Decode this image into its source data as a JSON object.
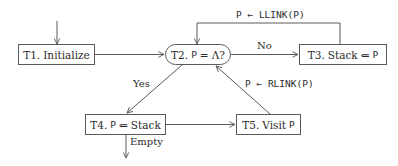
{
  "diagram": {
    "type": "flowchart",
    "title": "",
    "nodes": {
      "t1": {
        "id": "T1",
        "prefix": "T1.",
        "text": "Initialize",
        "shape": "rect"
      },
      "t2": {
        "id": "T2",
        "prefix": "T2.",
        "var": "P",
        "op": "=",
        "rhs": "Λ?",
        "shape": "rounded"
      },
      "t3": {
        "id": "T3",
        "prefix": "T3.",
        "text": "Stack",
        "op": "⇐",
        "var": "P",
        "shape": "rect"
      },
      "t4": {
        "id": "T4",
        "prefix": "T4.",
        "var": "P",
        "op": "⇐",
        "text": "Stack",
        "shape": "rect"
      },
      "t5": {
        "id": "T5",
        "prefix": "T5.",
        "text": "Visit",
        "var": "P",
        "shape": "rect"
      }
    },
    "edges": [
      {
        "from": "start",
        "to": "T1",
        "label": ""
      },
      {
        "from": "T1",
        "to": "T2",
        "label": ""
      },
      {
        "from": "T2",
        "to": "T3",
        "label": "No"
      },
      {
        "from": "T3",
        "to": "T2",
        "label": "P ← LLINK(P)"
      },
      {
        "from": "T2",
        "to": "T4",
        "label": "Yes"
      },
      {
        "from": "T4",
        "to": "T5",
        "label": ""
      },
      {
        "from": "T5",
        "to": "T2",
        "label": "P ← RLINK(P)"
      },
      {
        "from": "T4",
        "to": "end",
        "label": "Empty"
      }
    ],
    "labels": {
      "no": "No",
      "yes": "Yes",
      "empty": "Empty",
      "llink": "P ← LLINK(P)",
      "rlink": "P ← RLINK(P)"
    },
    "colors": {
      "stroke": "#5a5a5a",
      "text": "#2b2b2b",
      "background": "#ffffff"
    }
  }
}
